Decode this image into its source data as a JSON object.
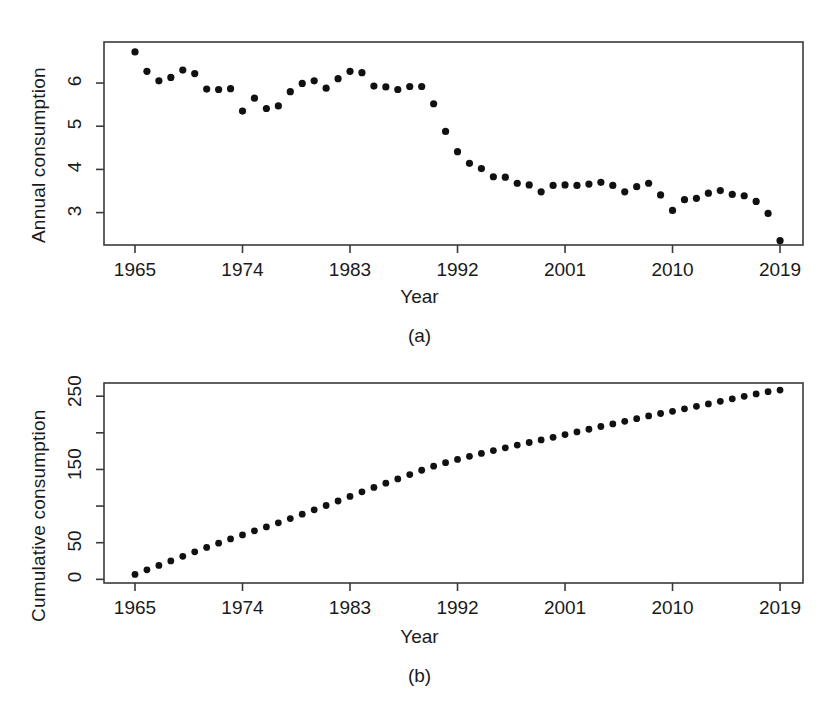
{
  "figure": {
    "background": "#ffffff",
    "point_color": "#111111",
    "axis_color": "#3a3a3a"
  },
  "panels": [
    {
      "caption": "(a)",
      "chart_index": 0
    },
    {
      "caption": "(b)",
      "chart_index": 1
    }
  ],
  "chart_data": [
    {
      "type": "scatter",
      "title": "",
      "xlabel": "Year",
      "ylabel": "Annual consumption",
      "xlim": [
        1965,
        2019
      ],
      "ylim": [
        2.25,
        6.95
      ],
      "xticks": [
        1965,
        1974,
        1983,
        1992,
        2001,
        2010,
        2019
      ],
      "xticklabels": [
        "1965",
        "1974",
        "1983",
        "1992",
        "2001",
        "2010",
        "2019"
      ],
      "yticks": [
        3,
        4,
        5,
        6
      ],
      "yticklabels": [
        "3",
        "4",
        "5",
        "6"
      ],
      "grid": false,
      "legend": "none",
      "x": [
        1965,
        1966,
        1967,
        1968,
        1969,
        1970,
        1971,
        1972,
        1973,
        1974,
        1975,
        1976,
        1977,
        1978,
        1979,
        1980,
        1981,
        1982,
        1983,
        1984,
        1985,
        1986,
        1987,
        1988,
        1989,
        1990,
        1991,
        1992,
        1993,
        1994,
        1995,
        1996,
        1997,
        1998,
        1999,
        2000,
        2001,
        2002,
        2003,
        2004,
        2005,
        2006,
        2007,
        2008,
        2009,
        2010,
        2011,
        2012,
        2013,
        2014,
        2015,
        2016,
        2017,
        2018,
        2019
      ],
      "values": [
        6.72,
        6.27,
        6.05,
        6.13,
        6.3,
        6.22,
        5.86,
        5.85,
        5.87,
        5.35,
        5.65,
        5.41,
        5.47,
        5.8,
        5.99,
        6.05,
        5.88,
        6.1,
        6.27,
        6.24,
        5.93,
        5.91,
        5.85,
        5.92,
        5.92,
        5.52,
        4.88,
        4.41,
        4.14,
        4.02,
        3.83,
        3.82,
        3.68,
        3.64,
        3.48,
        3.63,
        3.64,
        3.63,
        3.66,
        3.7,
        3.63,
        3.48,
        3.6,
        3.68,
        3.41,
        3.05,
        3.3,
        3.33,
        3.45,
        3.51,
        3.42,
        3.39,
        3.26,
        2.98,
        2.35
      ]
    },
    {
      "type": "scatter",
      "title": "",
      "xlabel": "Year",
      "ylabel": "Cumulative consumption",
      "xlim": [
        1965,
        2019
      ],
      "ylim": [
        -5,
        268
      ],
      "xticks": [
        1965,
        1974,
        1983,
        1992,
        2001,
        2010,
        2019
      ],
      "xticklabels": [
        "1965",
        "1974",
        "1983",
        "1992",
        "2001",
        "2010",
        "2019"
      ],
      "yticks": [
        0,
        50,
        100,
        150,
        200,
        250
      ],
      "yticklabels": [
        "0",
        "50",
        "",
        "150",
        "",
        "250"
      ],
      "grid": false,
      "legend": "none",
      "x": [
        1965,
        1966,
        1967,
        1968,
        1969,
        1970,
        1971,
        1972,
        1973,
        1974,
        1975,
        1976,
        1977,
        1978,
        1979,
        1980,
        1981,
        1982,
        1983,
        1984,
        1985,
        1986,
        1987,
        1988,
        1989,
        1990,
        1991,
        1992,
        1993,
        1994,
        1995,
        1996,
        1997,
        1998,
        1999,
        2000,
        2001,
        2002,
        2003,
        2004,
        2005,
        2006,
        2007,
        2008,
        2009,
        2010,
        2011,
        2012,
        2013,
        2014,
        2015,
        2016,
        2017,
        2018,
        2019
      ],
      "values": [
        6.7,
        13.0,
        19.0,
        25.1,
        31.4,
        37.6,
        43.5,
        49.4,
        55.2,
        60.6,
        66.2,
        71.6,
        77.1,
        82.9,
        88.9,
        94.9,
        100.8,
        106.9,
        113.2,
        119.4,
        125.4,
        131.3,
        137.1,
        143.0,
        148.9,
        154.4,
        159.3,
        163.7,
        167.9,
        171.9,
        175.7,
        179.5,
        183.2,
        186.8,
        190.3,
        193.9,
        197.6,
        201.2,
        204.9,
        208.6,
        212.2,
        215.7,
        219.3,
        223.0,
        226.4,
        229.4,
        232.7,
        236.1,
        239.5,
        243.0,
        246.4,
        249.8,
        253.1,
        256.1,
        258.4
      ]
    }
  ],
  "labels": {
    "year": "Year",
    "annual_consumption": "Annual consumption",
    "cumulative_consumption": "Cumulative consumption",
    "caption_a": "(a)",
    "caption_b": "(b)"
  }
}
